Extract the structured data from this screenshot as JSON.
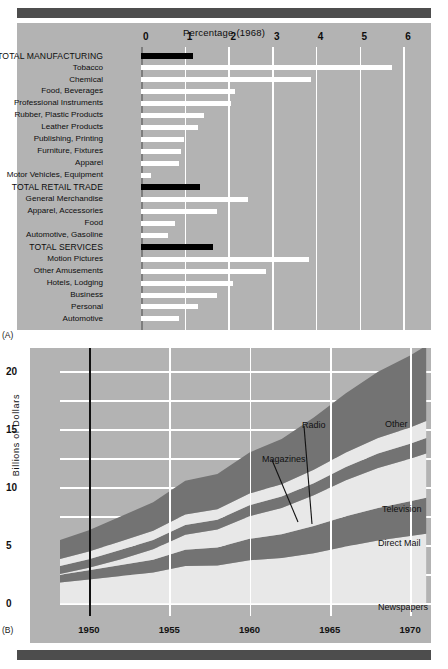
{
  "figure": {
    "panel_a_letter": "(A)",
    "panel_b_letter": "(B)"
  },
  "chart_data": [
    {
      "type": "bar",
      "panel": "A",
      "title": "Percentage  (1968)",
      "xlabel": "",
      "ylabel": "",
      "orientation": "horizontal",
      "xlim": [
        0,
        6.6
      ],
      "xticks": [
        0,
        1,
        2,
        3,
        4,
        5,
        6
      ],
      "xtick_labels": [
        "0",
        "1",
        "2",
        "3",
        "4",
        "5",
        "6"
      ],
      "grid": true,
      "categories": [
        "TOTAL MANUFACTURING",
        "Tobacco",
        "Chemical",
        "Food, Beverages",
        "Professional Instruments",
        "Rubber, Plastic Products",
        "Leather Products",
        "Publishing, Printing",
        "Furniture, Fixtures",
        "Apparel",
        "Motor Vehicles, Equipment",
        "TOTAL RETAIL TRADE",
        "General Merchandise",
        "Apparel, Accessories",
        "Food",
        "Automotive, Gasoline",
        "TOTAL SERVICES",
        "Motion Pictures",
        "Other Amusements",
        "Hotels, Lodging",
        "Business",
        "Personal",
        "Automotive"
      ],
      "values": [
        1.2,
        5.75,
        3.9,
        2.15,
        2.05,
        1.45,
        1.3,
        0.98,
        0.92,
        0.88,
        0.22,
        1.35,
        2.45,
        1.75,
        0.78,
        0.62,
        1.65,
        3.85,
        2.85,
        2.1,
        1.75,
        1.3,
        0.88
      ],
      "emphasis_indices": [
        0,
        11,
        16
      ],
      "emphasis_color": "#000000",
      "bar_color": "#ffffff",
      "background_color": "#b3b3b3"
    },
    {
      "type": "area",
      "panel": "B",
      "title": "",
      "xlabel": "",
      "ylabel": "Billions of Dollars",
      "stacked": true,
      "xlim": [
        1948.2,
        1971.3
      ],
      "ylim": [
        -1.1,
        22.0
      ],
      "xticks": [
        1950,
        1955,
        1960,
        1965,
        1970
      ],
      "xtick_labels": [
        "1950",
        "1955",
        "1960",
        "1965",
        "1970"
      ],
      "yticks": [
        0,
        5,
        10,
        15,
        20
      ],
      "ytick_labels": [
        "0",
        "5",
        "10",
        "15",
        "20"
      ],
      "minor_yticks": [
        2.5,
        7.5,
        12.5,
        17.5
      ],
      "grid": true,
      "background_color": "#b3b3b3",
      "light_band_color": "#e8e8e8",
      "dark_band_color": "#737373",
      "annotations": [
        {
          "label": "Radio",
          "x": 302,
          "y": 420
        },
        {
          "label": "Magazines",
          "x": 262,
          "y": 454
        },
        {
          "label": "Other",
          "x": 385,
          "y": 419
        },
        {
          "label": "Television",
          "x": 382,
          "y": 504
        },
        {
          "label": "Direct Mail",
          "x": 378,
          "y": 538
        },
        {
          "label": "Newspapers",
          "x": 378,
          "y": 602
        }
      ],
      "x": [
        1948,
        1950,
        1952,
        1954,
        1956,
        1958,
        1960,
        1962,
        1964,
        1966,
        1968,
        1970,
        1971
      ],
      "series": [
        {
          "name": "Newspapers",
          "values": [
            1.75,
            2.05,
            2.35,
            2.65,
            3.2,
            3.25,
            3.7,
            3.9,
            4.3,
            4.9,
            5.4,
            5.8,
            6.0
          ]
        },
        {
          "name": "Direct Mail",
          "values": [
            0.65,
            0.8,
            0.95,
            1.1,
            1.4,
            1.55,
            1.85,
            2.05,
            2.35,
            2.6,
            2.8,
            3.0,
            3.1
          ]
        },
        {
          "name": "Television",
          "values": [
            0.05,
            0.2,
            0.5,
            0.9,
            1.3,
            1.55,
            1.95,
            2.25,
            2.65,
            3.1,
            3.45,
            3.65,
            3.8
          ]
        },
        {
          "name": "Radio",
          "values": [
            0.7,
            0.75,
            0.8,
            0.8,
            0.85,
            0.85,
            0.95,
            1.0,
            1.05,
            1.15,
            1.25,
            1.3,
            1.35
          ]
        },
        {
          "name": "Magazines",
          "values": [
            0.6,
            0.65,
            0.75,
            0.8,
            0.9,
            0.9,
            1.0,
            1.05,
            1.15,
            1.25,
            1.35,
            1.4,
            1.45
          ]
        },
        {
          "name": "Other",
          "values": [
            1.6,
            1.85,
            2.15,
            2.45,
            2.9,
            3.05,
            3.55,
            3.9,
            4.5,
            5.1,
            5.7,
            6.2,
            6.5
          ]
        }
      ]
    }
  ]
}
